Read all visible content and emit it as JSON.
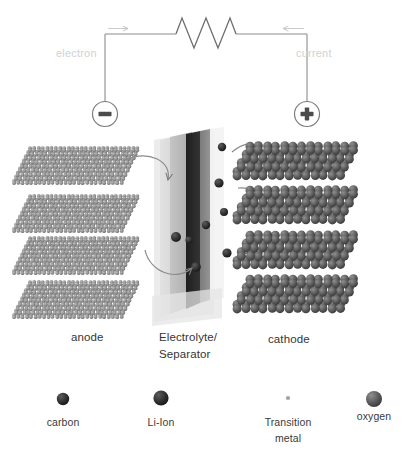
{
  "figure": {
    "background": "#ffffff"
  },
  "circuit": {
    "electron_label": "electron",
    "current_label": "current",
    "negative_terminal_symbol": "−",
    "positive_terminal_symbol": "+",
    "wire_color": "#8a8a8a",
    "label_color": "#d2d2d2",
    "resistor_name": "resistor-zigzag",
    "electron_arrow_direction": "right",
    "current_arrow_direction": "left"
  },
  "cell": {
    "anode_label": "anode",
    "electrolyte_label_line1": "Electrolyte/",
    "electrolyte_label_line2": "Separator",
    "cathode_label": "cathode",
    "anode_layer_count": 4,
    "cathode_layer_count": 4,
    "anode_color": "#8d8d8d",
    "cathode_color": "#5e5e5e",
    "separator_light_color": "#d9d9d9",
    "separator_mid_color": "#b5b5b5",
    "separator_dark_color": "#2a2a2a",
    "ion_color": "#2f2f2f",
    "arrow_color": "#7d7d7d",
    "ion_count": 8
  },
  "legend": {
    "items": [
      {
        "label": "carbon",
        "color": "#4a4a4a",
        "size": 7,
        "icon": "sphere-icon"
      },
      {
        "label": "Li-Ion",
        "color": "#555555",
        "size": 11,
        "icon": "sphere-icon"
      },
      {
        "label": "Transition\nmetal",
        "color": "#9a9a9a",
        "size": 3,
        "icon": "sphere-icon"
      },
      {
        "label": "oxygen",
        "color": "#5a5a5a",
        "size": 12,
        "icon": "sphere-icon"
      }
    ],
    "item_labels": {
      "carbon": "carbon",
      "li_ion": "Li-Ion",
      "transition_metal_line1": "Transition",
      "transition_metal_line2": "metal",
      "oxygen": "oxygen"
    }
  }
}
